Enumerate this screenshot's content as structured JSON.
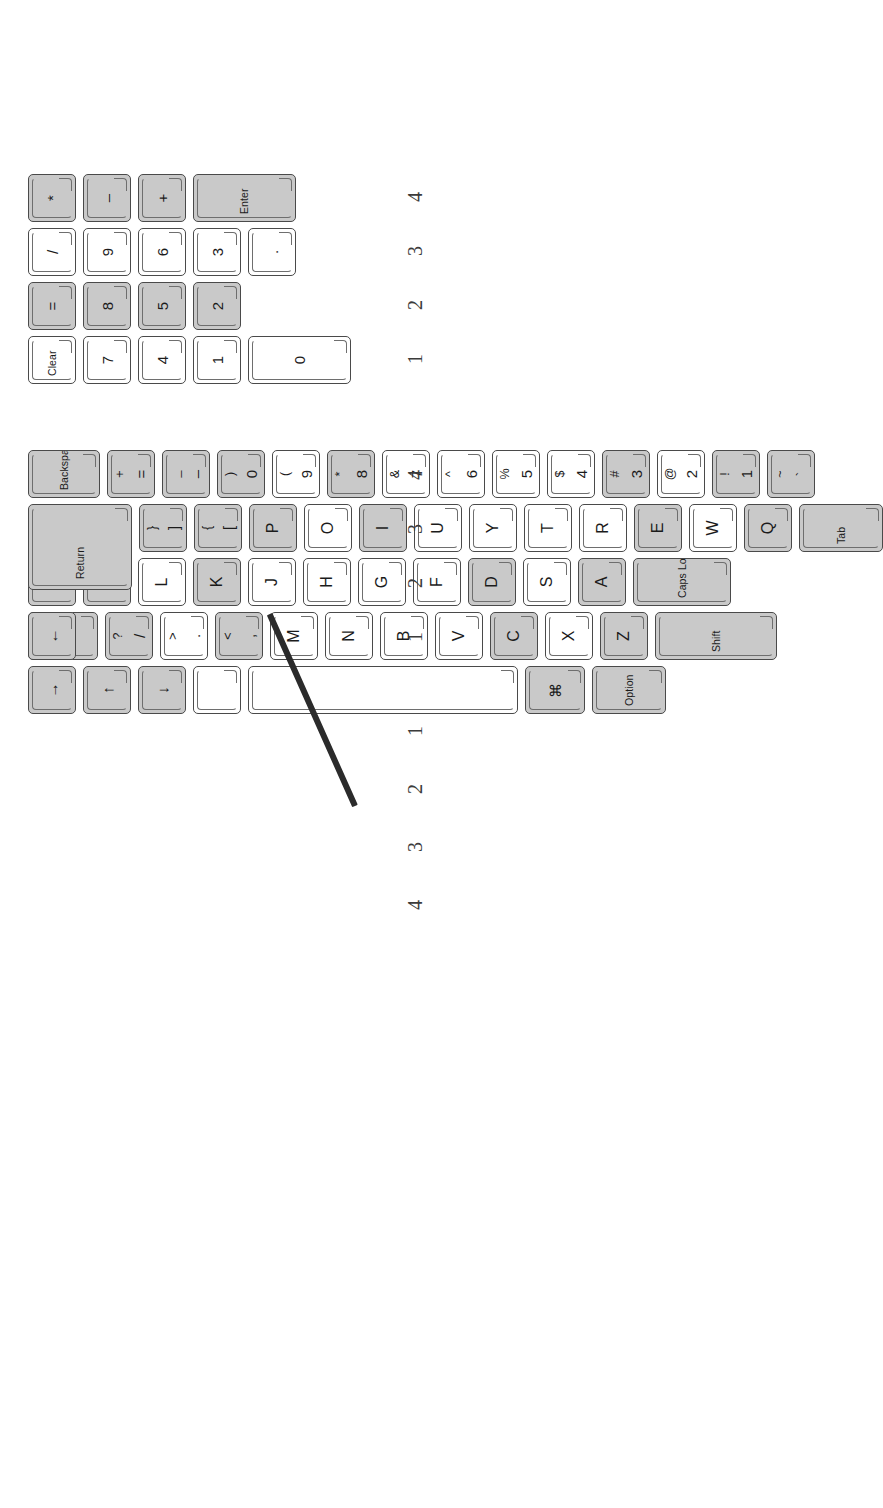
{
  "figure": {
    "orientation": "rotated-90-ccw",
    "colors": {
      "key_fill": "#ffffff",
      "key_fill_shaded": "#c9c9c9",
      "key_outline": "#4a4a4a",
      "label_text": "#1b1b1b",
      "ruler_text": "#3b3b3b",
      "pointer": "#2b2b2b",
      "page_background": "#ffffff"
    }
  },
  "keypad": {
    "name": "numeric-keypad",
    "row_labels": [
      "1",
      "2",
      "3",
      "4"
    ],
    "rows": [
      {
        "label": "1",
        "keys": [
          {
            "name": "keypad-clear",
            "legend": "Clear",
            "style": "word",
            "shaded": false
          },
          {
            "name": "keypad-7",
            "legend": "7",
            "style": "single",
            "shaded": false
          },
          {
            "name": "keypad-4",
            "legend": "4",
            "style": "single",
            "shaded": false
          },
          {
            "name": "keypad-1",
            "legend": "1",
            "style": "single",
            "shaded": false
          },
          {
            "name": "keypad-0",
            "legend": "0",
            "style": "single",
            "shaded": false,
            "wide": true
          }
        ]
      },
      {
        "label": "2",
        "keys": [
          {
            "name": "keypad-equals",
            "legend": "=",
            "style": "single",
            "shaded": true
          },
          {
            "name": "keypad-8",
            "legend": "8",
            "style": "single",
            "shaded": true
          },
          {
            "name": "keypad-5",
            "legend": "5",
            "style": "single",
            "shaded": true
          },
          {
            "name": "keypad-2",
            "legend": "2",
            "style": "single",
            "shaded": true
          }
        ]
      },
      {
        "label": "3",
        "keys": [
          {
            "name": "keypad-slash",
            "legend": "/",
            "style": "single",
            "shaded": false
          },
          {
            "name": "keypad-9",
            "legend": "9",
            "style": "single",
            "shaded": false
          },
          {
            "name": "keypad-6",
            "legend": "6",
            "style": "single",
            "shaded": false
          },
          {
            "name": "keypad-3",
            "legend": "3",
            "style": "single",
            "shaded": false
          },
          {
            "name": "keypad-period",
            "legend": ".",
            "style": "single",
            "shaded": false
          }
        ]
      },
      {
        "label": "4",
        "keys": [
          {
            "name": "keypad-asterisk",
            "legend": "*",
            "style": "single",
            "shaded": true
          },
          {
            "name": "keypad-minus",
            "legend": "–",
            "style": "single",
            "shaded": true
          },
          {
            "name": "keypad-plus",
            "legend": "+",
            "style": "single",
            "shaded": true
          },
          {
            "name": "keypad-enter",
            "legend": "Enter",
            "style": "word",
            "shaded": true,
            "tall": true
          }
        ]
      }
    ]
  },
  "main": {
    "name": "main-keyboard",
    "row_labels": [
      "4",
      "3",
      "2",
      "1",
      "1",
      "2",
      "3",
      "4"
    ],
    "rows": [
      {
        "label": "4",
        "name": "number-row",
        "keys": [
          {
            "name": "key-tilde",
            "upper": "~",
            "lower": "`",
            "style": "double",
            "shaded": true
          },
          {
            "name": "key-1",
            "upper": "!",
            "lower": "1",
            "style": "double",
            "shaded": true
          },
          {
            "name": "key-2",
            "upper": "@",
            "lower": "2",
            "style": "double",
            "shaded": false
          },
          {
            "name": "key-3",
            "upper": "#",
            "lower": "3",
            "style": "double",
            "shaded": true
          },
          {
            "name": "key-4",
            "upper": "$",
            "lower": "4",
            "style": "double",
            "shaded": false
          },
          {
            "name": "key-5",
            "upper": "%",
            "lower": "5",
            "style": "double",
            "shaded": false
          },
          {
            "name": "key-6",
            "upper": "^",
            "lower": "6",
            "style": "double",
            "shaded": false
          },
          {
            "name": "key-7",
            "upper": "&",
            "lower": "7",
            "style": "double",
            "shaded": false
          },
          {
            "name": "key-8",
            "upper": "*",
            "lower": "8",
            "style": "double",
            "shaded": true
          },
          {
            "name": "key-9",
            "upper": "(",
            "lower": "9",
            "style": "double",
            "shaded": false
          },
          {
            "name": "key-0",
            "upper": ")",
            "lower": "0",
            "style": "double",
            "shaded": true
          },
          {
            "name": "key-minus",
            "upper": "_",
            "lower": "–",
            "style": "double",
            "shaded": true
          },
          {
            "name": "key-equals",
            "upper": "+",
            "lower": "=",
            "style": "double",
            "shaded": true
          },
          {
            "name": "key-backspace",
            "legend": "Backspace",
            "style": "word",
            "shaded": true
          }
        ]
      },
      {
        "label": "3",
        "name": "qwerty-row",
        "keys": [
          {
            "name": "key-tab",
            "legend": "Tab",
            "style": "word",
            "shaded": true
          },
          {
            "name": "key-q",
            "legend": "Q",
            "style": "letter",
            "shaded": true
          },
          {
            "name": "key-w",
            "legend": "W",
            "style": "letter",
            "shaded": false
          },
          {
            "name": "key-e",
            "legend": "E",
            "style": "letter",
            "shaded": true
          },
          {
            "name": "key-r",
            "legend": "R",
            "style": "letter",
            "shaded": false
          },
          {
            "name": "key-t",
            "legend": "T",
            "style": "letter",
            "shaded": false
          },
          {
            "name": "key-y",
            "legend": "Y",
            "style": "letter",
            "shaded": false
          },
          {
            "name": "key-u",
            "legend": "U",
            "style": "letter",
            "shaded": false
          },
          {
            "name": "key-i",
            "legend": "I",
            "style": "letter",
            "shaded": true
          },
          {
            "name": "key-o",
            "legend": "O",
            "style": "letter",
            "shaded": false
          },
          {
            "name": "key-p",
            "legend": "P",
            "style": "letter",
            "shaded": true
          },
          {
            "name": "key-bracket-left",
            "upper": "{",
            "lower": "[",
            "style": "double",
            "shaded": true
          },
          {
            "name": "key-bracket-right",
            "upper": "}",
            "lower": "]",
            "style": "double",
            "shaded": true
          },
          {
            "name": "key-return",
            "legend": "Return",
            "style": "word",
            "shaded": true
          }
        ]
      },
      {
        "label": "2",
        "name": "home-row",
        "keys": [
          {
            "name": "key-caps-lock",
            "legend": "Caps Lock",
            "style": "word",
            "shaded": true
          },
          {
            "name": "key-a",
            "legend": "A",
            "style": "letter",
            "shaded": true
          },
          {
            "name": "key-s",
            "legend": "S",
            "style": "letter",
            "shaded": false
          },
          {
            "name": "key-d",
            "legend": "D",
            "style": "letter",
            "shaded": true
          },
          {
            "name": "key-f",
            "legend": "F",
            "style": "letter",
            "shaded": false
          },
          {
            "name": "key-g",
            "legend": "G",
            "style": "letter",
            "shaded": false
          },
          {
            "name": "key-h",
            "legend": "H",
            "style": "letter",
            "shaded": false
          },
          {
            "name": "key-j",
            "legend": "J",
            "style": "letter",
            "shaded": false
          },
          {
            "name": "key-k",
            "legend": "K",
            "style": "letter",
            "shaded": true
          },
          {
            "name": "key-l",
            "legend": "L",
            "style": "letter",
            "shaded": false
          },
          {
            "name": "key-semicolon",
            "upper": ":",
            "lower": ";",
            "style": "double",
            "shaded": true
          },
          {
            "name": "key-quote",
            "upper": "\"",
            "lower": "'",
            "style": "double",
            "shaded": true
          }
        ]
      },
      {
        "label": "1",
        "name": "bottom-letter-row",
        "keys": [
          {
            "name": "key-shift-left",
            "legend": "Shift",
            "style": "word",
            "shaded": true
          },
          {
            "name": "key-z",
            "legend": "Z",
            "style": "letter",
            "shaded": true
          },
          {
            "name": "key-x",
            "legend": "X",
            "style": "letter",
            "shaded": false
          },
          {
            "name": "key-c",
            "legend": "C",
            "style": "letter",
            "shaded": true
          },
          {
            "name": "key-v",
            "legend": "V",
            "style": "letter",
            "shaded": false
          },
          {
            "name": "key-b",
            "legend": "B",
            "style": "letter",
            "shaded": false
          },
          {
            "name": "key-n",
            "legend": "N",
            "style": "letter",
            "shaded": false
          },
          {
            "name": "key-m",
            "legend": "M",
            "style": "letter",
            "shaded": false
          },
          {
            "name": "key-comma",
            "upper": "<",
            "lower": ",",
            "style": "double",
            "shaded": true
          },
          {
            "name": "key-period",
            "upper": ">",
            "lower": ".",
            "style": "double",
            "shaded": false
          },
          {
            "name": "key-slash",
            "upper": "?",
            "lower": "/",
            "style": "double",
            "shaded": true
          },
          {
            "name": "key-shift-right",
            "legend": "Shift",
            "style": "word",
            "shaded": true
          }
        ]
      },
      {
        "label": "1",
        "name": "modifier-row",
        "keys": [
          {
            "name": "key-option",
            "legend": "Option",
            "style": "word",
            "shaded": true
          },
          {
            "name": "key-command",
            "legend": "⌘",
            "style": "cmd",
            "shaded": true
          },
          {
            "name": "key-space",
            "legend": "",
            "style": "blank",
            "shaded": false
          },
          {
            "name": "key-enter-bar",
            "legend": "",
            "style": "blank",
            "shaded": false
          }
        ]
      }
    ],
    "arrow_keys": [
      {
        "name": "arrow-left-key",
        "legend": "←",
        "shaded": true
      },
      {
        "name": "arrow-up-key",
        "legend": "↑",
        "shaded": true
      },
      {
        "name": "arrow-down-key",
        "legend": "↓",
        "shaded": true
      },
      {
        "name": "arrow-right-key",
        "legend": "→",
        "shaded": true
      }
    ]
  }
}
